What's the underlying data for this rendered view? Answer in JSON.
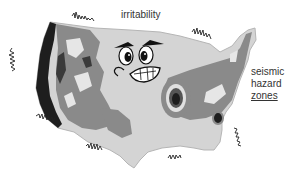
{
  "illustration": {
    "subject": "Cartoon map of the contiguous United States with an angry face, shaded seismic hazard zones, and seismograph squiggles around the coast",
    "labels": {
      "title": "irritability",
      "legend_line1": "seismic",
      "legend_line2": "hazard",
      "legend_line3": "zones"
    },
    "colors": {
      "background": "#ffffff",
      "land_light": "#d4d4d4",
      "hazard_medium": "#8a8a8a",
      "hazard_high": "#555555",
      "hazard_extreme": "#1e1e1e",
      "text": "#333333"
    },
    "icons": [
      "angry-face-icon",
      "seismograph-squiggle-icon"
    ]
  }
}
